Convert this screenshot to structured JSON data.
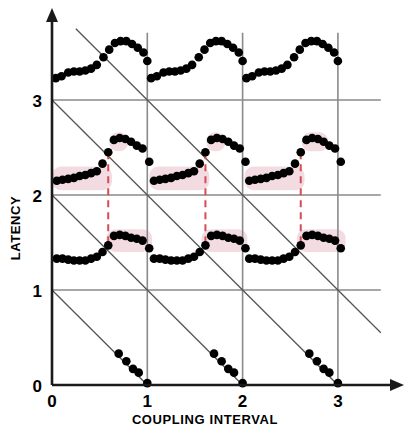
{
  "chart_data": {
    "type": "scatter",
    "title": "",
    "xlabel": "COUPLING INTERVAL",
    "ylabel": "LATENCY",
    "xlim": [
      0,
      3.45
    ],
    "ylim": [
      0,
      3.75
    ],
    "xticks": [
      0,
      1,
      2,
      3
    ],
    "xticklabels": [
      "0",
      "1",
      "2",
      "3"
    ],
    "yticks": [
      0,
      1,
      2,
      3
    ],
    "yticklabels": [
      "0",
      "1",
      "2",
      "3"
    ],
    "grid": true,
    "grid_color": "#8a8a8a",
    "legend": "none",
    "marker_color": "#000000",
    "marker_size": 6,
    "shade_color": "#f2dadf",
    "dashed_line_color": "#d94a52",
    "diagonal_line_color": "#555555",
    "diagonal_slope": -1,
    "diagonal_intercepts": [
      1,
      2,
      3,
      4
    ],
    "annotations": [
      {
        "name": "discontinuity-marker-1",
        "x": 0.59,
        "y_top": 2.45,
        "y_bottom": 1.47
      },
      {
        "name": "discontinuity-marker-2",
        "x": 1.61,
        "y_top": 2.45,
        "y_bottom": 1.47
      },
      {
        "name": "discontinuity-marker-3",
        "x": 2.61,
        "y_top": 2.45,
        "y_bottom": 1.47
      }
    ],
    "series": [
      {
        "name": "branch-upper",
        "points": [
          [
            0.04,
            3.23
          ],
          [
            0.1,
            3.25
          ],
          [
            0.17,
            3.29
          ],
          [
            0.23,
            3.3
          ],
          [
            0.29,
            3.3
          ],
          [
            0.35,
            3.31
          ],
          [
            0.41,
            3.33
          ],
          [
            0.47,
            3.37
          ],
          [
            0.54,
            3.45
          ],
          [
            0.6,
            3.53
          ],
          [
            0.66,
            3.6
          ],
          [
            0.72,
            3.62
          ],
          [
            0.78,
            3.62
          ],
          [
            0.84,
            3.59
          ],
          [
            0.9,
            3.55
          ],
          [
            0.96,
            3.5
          ],
          [
            1.0,
            3.41
          ],
          [
            1.04,
            3.23
          ],
          [
            1.1,
            3.25
          ],
          [
            1.17,
            3.29
          ],
          [
            1.23,
            3.3
          ],
          [
            1.29,
            3.3
          ],
          [
            1.35,
            3.31
          ],
          [
            1.41,
            3.33
          ],
          [
            1.47,
            3.37
          ],
          [
            1.54,
            3.45
          ],
          [
            1.6,
            3.53
          ],
          [
            1.66,
            3.6
          ],
          [
            1.72,
            3.62
          ],
          [
            1.78,
            3.62
          ],
          [
            1.84,
            3.59
          ],
          [
            1.9,
            3.55
          ],
          [
            1.96,
            3.5
          ],
          [
            2.0,
            3.41
          ],
          [
            2.04,
            3.23
          ],
          [
            2.1,
            3.25
          ],
          [
            2.17,
            3.29
          ],
          [
            2.23,
            3.3
          ],
          [
            2.29,
            3.3
          ],
          [
            2.35,
            3.31
          ],
          [
            2.41,
            3.33
          ],
          [
            2.47,
            3.37
          ],
          [
            2.54,
            3.45
          ],
          [
            2.6,
            3.53
          ],
          [
            2.66,
            3.6
          ],
          [
            2.72,
            3.62
          ],
          [
            2.78,
            3.62
          ],
          [
            2.84,
            3.59
          ],
          [
            2.9,
            3.55
          ],
          [
            2.96,
            3.5
          ],
          [
            3.0,
            3.41
          ]
        ]
      },
      {
        "name": "branch-middle",
        "shaded": true,
        "points": [
          [
            0.05,
            2.15
          ],
          [
            0.11,
            2.16
          ],
          [
            0.17,
            2.17
          ],
          [
            0.23,
            2.18
          ],
          [
            0.29,
            2.2
          ],
          [
            0.35,
            2.21
          ],
          [
            0.41,
            2.23
          ],
          [
            0.47,
            2.25
          ],
          [
            0.53,
            2.33
          ],
          [
            0.59,
            2.45
          ],
          [
            0.65,
            2.58
          ],
          [
            0.71,
            2.6
          ],
          [
            0.77,
            2.59
          ],
          [
            0.83,
            2.56
          ],
          [
            0.89,
            2.52
          ],
          [
            0.95,
            2.49
          ],
          [
            1.02,
            2.35
          ],
          [
            1.07,
            2.15
          ],
          [
            1.13,
            2.16
          ],
          [
            1.19,
            2.17
          ],
          [
            1.25,
            2.18
          ],
          [
            1.31,
            2.2
          ],
          [
            1.37,
            2.21
          ],
          [
            1.43,
            2.23
          ],
          [
            1.49,
            2.25
          ],
          [
            1.55,
            2.33
          ],
          [
            1.61,
            2.45
          ],
          [
            1.67,
            2.58
          ],
          [
            1.73,
            2.6
          ],
          [
            1.79,
            2.59
          ],
          [
            1.85,
            2.56
          ],
          [
            1.91,
            2.52
          ],
          [
            1.97,
            2.49
          ],
          [
            2.03,
            2.35
          ],
          [
            2.07,
            2.15
          ],
          [
            2.13,
            2.16
          ],
          [
            2.19,
            2.17
          ],
          [
            2.25,
            2.18
          ],
          [
            2.31,
            2.2
          ],
          [
            2.37,
            2.21
          ],
          [
            2.43,
            2.23
          ],
          [
            2.49,
            2.25
          ],
          [
            2.55,
            2.33
          ],
          [
            2.61,
            2.45
          ],
          [
            2.67,
            2.58
          ],
          [
            2.73,
            2.6
          ],
          [
            2.79,
            2.59
          ],
          [
            2.85,
            2.56
          ],
          [
            2.91,
            2.52
          ],
          [
            2.97,
            2.49
          ],
          [
            3.03,
            2.35
          ]
        ]
      },
      {
        "name": "branch-lower",
        "shaded": true,
        "points": [
          [
            0.05,
            1.33
          ],
          [
            0.11,
            1.33
          ],
          [
            0.17,
            1.32
          ],
          [
            0.23,
            1.31
          ],
          [
            0.29,
            1.31
          ],
          [
            0.35,
            1.31
          ],
          [
            0.41,
            1.33
          ],
          [
            0.47,
            1.35
          ],
          [
            0.53,
            1.4
          ],
          [
            0.59,
            1.47
          ],
          [
            0.65,
            1.57
          ],
          [
            0.71,
            1.58
          ],
          [
            0.77,
            1.57
          ],
          [
            0.83,
            1.55
          ],
          [
            0.89,
            1.54
          ],
          [
            0.95,
            1.52
          ],
          [
            1.02,
            1.44
          ],
          [
            1.07,
            1.33
          ],
          [
            1.13,
            1.33
          ],
          [
            1.19,
            1.32
          ],
          [
            1.25,
            1.31
          ],
          [
            1.31,
            1.31
          ],
          [
            1.37,
            1.31
          ],
          [
            1.43,
            1.33
          ],
          [
            1.49,
            1.35
          ],
          [
            1.55,
            1.4
          ],
          [
            1.61,
            1.47
          ],
          [
            1.67,
            1.57
          ],
          [
            1.73,
            1.58
          ],
          [
            1.79,
            1.57
          ],
          [
            1.85,
            1.55
          ],
          [
            1.91,
            1.54
          ],
          [
            1.97,
            1.52
          ],
          [
            2.03,
            1.44
          ],
          [
            2.07,
            1.33
          ],
          [
            2.13,
            1.33
          ],
          [
            2.19,
            1.32
          ],
          [
            2.25,
            1.31
          ],
          [
            2.31,
            1.31
          ],
          [
            2.37,
            1.31
          ],
          [
            2.43,
            1.33
          ],
          [
            2.49,
            1.35
          ],
          [
            2.55,
            1.4
          ],
          [
            2.61,
            1.47
          ],
          [
            2.67,
            1.57
          ],
          [
            2.73,
            1.58
          ],
          [
            2.79,
            1.57
          ],
          [
            2.85,
            1.55
          ],
          [
            2.91,
            1.54
          ],
          [
            2.97,
            1.52
          ],
          [
            3.03,
            1.44
          ]
        ]
      },
      {
        "name": "branch-bottom",
        "points": [
          [
            0.7,
            0.33
          ],
          [
            0.78,
            0.25
          ],
          [
            0.85,
            0.17
          ],
          [
            0.91,
            0.13
          ],
          [
            1.0,
            0.02
          ],
          [
            1.7,
            0.33
          ],
          [
            1.78,
            0.25
          ],
          [
            1.85,
            0.17
          ],
          [
            1.91,
            0.13
          ],
          [
            2.0,
            0.02
          ],
          [
            2.7,
            0.33
          ],
          [
            2.78,
            0.25
          ],
          [
            2.85,
            0.17
          ],
          [
            2.91,
            0.13
          ],
          [
            3.0,
            0.02
          ]
        ]
      }
    ],
    "shaded_bands": [
      {
        "name": "shade-middle-1",
        "x0": 0.0,
        "x1": 0.63,
        "y0": 2.05,
        "y1": 2.3
      },
      {
        "name": "shade-middle-1b",
        "x0": 0.6,
        "x1": 0.8,
        "y0": 2.46,
        "y1": 2.66
      },
      {
        "name": "shade-middle-2",
        "x0": 1.02,
        "x1": 1.65,
        "y0": 2.05,
        "y1": 2.3
      },
      {
        "name": "shade-middle-2b",
        "x0": 1.62,
        "x1": 1.82,
        "y0": 2.46,
        "y1": 2.66
      },
      {
        "name": "shade-middle-3",
        "x0": 2.02,
        "x1": 2.65,
        "y0": 2.05,
        "y1": 2.3
      },
      {
        "name": "shade-middle-3b",
        "x0": 2.62,
        "x1": 2.9,
        "y0": 2.46,
        "y1": 2.66
      },
      {
        "name": "shade-lower-1",
        "x0": 0.57,
        "x1": 1.05,
        "y0": 1.4,
        "y1": 1.64
      },
      {
        "name": "shade-lower-2",
        "x0": 1.57,
        "x1": 2.05,
        "y0": 1.4,
        "y1": 1.64
      },
      {
        "name": "shade-lower-3",
        "x0": 2.57,
        "x1": 3.08,
        "y0": 1.4,
        "y1": 1.64
      }
    ]
  },
  "axes": {
    "x_label": "COUPLING INTERVAL",
    "y_label": "LATENCY",
    "x_tick_labels": [
      "0",
      "1",
      "2",
      "3"
    ],
    "y_tick_labels": [
      "0",
      "1",
      "2",
      "3"
    ],
    "origin_label": "0"
  }
}
